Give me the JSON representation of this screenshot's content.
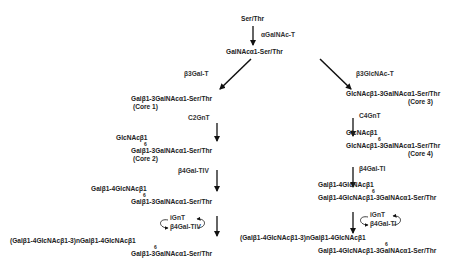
{
  "diagram": {
    "start": "Ser/Thr",
    "step1_enzyme": "αGalNAc-T",
    "tn_antigen": "GalNAcα1-Ser/Thr",
    "left_branch": {
      "enzyme_core1": "β3Gal-T",
      "core1_structure": "Galβ1-3GalNAcα1-Ser/Thr",
      "core1_label": "(Core 1)",
      "enzyme_core2": "C2GnT",
      "core2_branch": "GlcNAcβ1",
      "core2_linkage": "6",
      "core2_structure": "Galβ1-3GalNAcα1-Ser/Thr",
      "core2_label": "(Core 2)",
      "enzyme_gal": "β4Gal-TIV",
      "lacnac_branch": "Galβ1-4GlcNAcβ1",
      "lacnac_linkage": "6",
      "lacnac_structure": "Galβ1-3GalNAcα1-Ser/Thr",
      "loop_enzyme_1": "iGnT",
      "loop_enzyme_2": "β4Gal-TIV",
      "poly_branch": "(Galβ1-4GlcNAcβ1-3)nGalβ1-4GlcNAcβ1",
      "poly_linkage": "6",
      "poly_structure": "Galβ1-3GalNAcα1-Ser/Thr"
    },
    "right_branch": {
      "enzyme_core3": "β3GlcNAc-T",
      "core3_structure": "GlcNAcβ1-3GalNAcα1-Ser/Thr",
      "core3_label": "(Core 3)",
      "enzyme_core4": "C4GnT",
      "core4_branch": "GlcNAcβ1",
      "core4_linkage": "6",
      "core4_structure": "GlcNAcβ1-3GalNAcα1-Ser/Thr",
      "core4_label": "(Core 4)",
      "enzyme_gal": "β4Gal-TI",
      "lacnac_branch": "Galβ1-4GlcNAcβ1",
      "lacnac_linkage": "6",
      "lacnac_structure": "Galβ1-4GlcNAcβ1-3GalNAcα1-Ser/Thr",
      "loop_enzyme_1": "iGnT",
      "loop_enzyme_2": "β4Gal-TI",
      "poly_branch": "(Galβ1-4GlcNAcβ1-3)nGalβ1-4GlcNAcβ1",
      "poly_linkage": "6",
      "poly_structure": "Galβ1-4GlcNAcβ1-3GalNAcα1-Ser/Thr"
    }
  }
}
